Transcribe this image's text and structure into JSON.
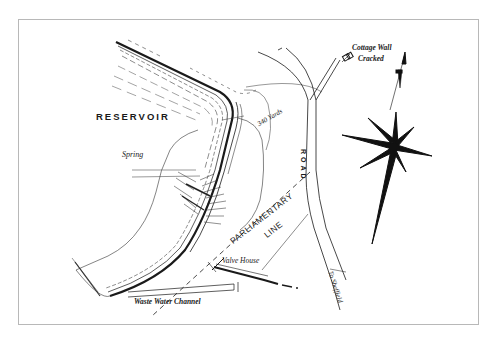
{
  "map": {
    "labels": {
      "reservoir": "RESERVOIR",
      "spring": "Spring",
      "yards": "340 Yards",
      "cottage_line1": "Cottage Wall",
      "cottage_line2": "Cracked",
      "road": "ROAD",
      "parliamentary_line1": "PARLIAMENTARY",
      "parliamentary_line2": "LINE",
      "valve_house": "Valve House",
      "waste_water": "Waste Water Channel",
      "to_sheffield": "To Sheffield"
    },
    "colors": {
      "ink": "#1a1a1a",
      "frame": "#b8b8b8",
      "paper": "#ffffff"
    },
    "features": [
      "reservoir",
      "dam embankment",
      "road",
      "parliamentary line",
      "valve house",
      "waste water channel",
      "cottage",
      "compass rose"
    ]
  }
}
